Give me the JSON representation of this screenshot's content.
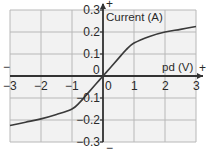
{
  "chart_data": {
    "type": "line",
    "title": "",
    "xlabel": "pd (V)",
    "ylabel": "Current (A)",
    "xlim": [
      -3,
      3
    ],
    "ylim": [
      -0.3,
      0.3
    ],
    "grid": true,
    "x_ticks": [
      "−3",
      "−2",
      "−1",
      "0",
      "1",
      "2",
      "3"
    ],
    "y_ticks": [
      "0.3",
      "0.2",
      "0.1",
      "0",
      "−0.1",
      "−0.2",
      "−0.3"
    ],
    "axis_end_markers": {
      "x_positive": "+",
      "x_negative": "−",
      "y_positive": "+",
      "y_negative": "−"
    },
    "series": [
      {
        "name": "Current vs pd",
        "x": [
          -3,
          -2.5,
          -2,
          -1.5,
          -1,
          -0.75,
          -0.5,
          -0.25,
          0,
          0.25,
          0.5,
          0.75,
          1,
          1.5,
          2,
          2.5,
          3
        ],
        "values": [
          -0.225,
          -0.21,
          -0.195,
          -0.175,
          -0.15,
          -0.12,
          -0.08,
          -0.04,
          0,
          0.04,
          0.08,
          0.12,
          0.15,
          0.18,
          0.2,
          0.212,
          0.225
        ]
      }
    ],
    "colors": {
      "grid": "#b8b8b8",
      "axis": "#333333",
      "curve": "#3a3a3a",
      "plot_bg": "#efefef"
    }
  }
}
